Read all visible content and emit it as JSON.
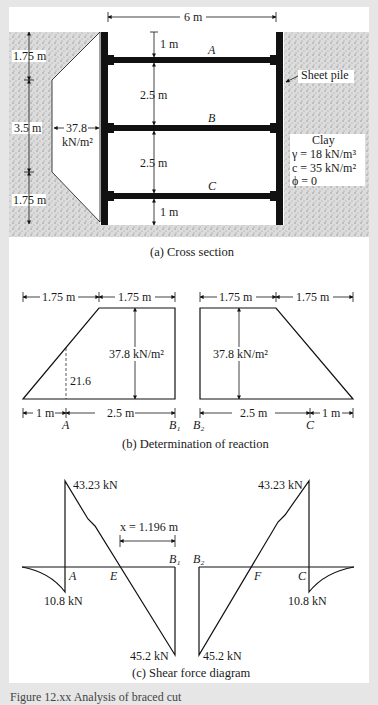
{
  "figure": {
    "caption_partial": "Figure 12.xx  Analysis of braced cut",
    "panels": {
      "a": {
        "caption": "(a) Cross section",
        "width_label": "6 m",
        "strut_labels": [
          "A",
          "B",
          "C"
        ],
        "vertical_spacings": [
          "1 m",
          "2.5 m",
          "2.5 m",
          "1 m"
        ],
        "pressure_zone_heights": [
          "1.75 m",
          "3.5 m",
          "1.75 m"
        ],
        "pressure_value": "37.8",
        "pressure_unit": "kN/m²",
        "sheet_pile_label": "Sheet pile",
        "soil": {
          "name": "Clay",
          "gamma": "γ = 18 kN/m³",
          "c": "c = 35 kN/m²",
          "phi": "ϕ = 0"
        }
      },
      "b": {
        "caption": "(b) Determination of reaction",
        "left": {
          "top_dims": [
            "1.75 m",
            "1.75 m"
          ],
          "bottom_dims": [
            "1 m",
            "2.5 m"
          ],
          "pressure_label": "37.8 kN/m²",
          "intermediate_value": "21.6",
          "support_labels": [
            "A",
            "B₁"
          ]
        },
        "right": {
          "top_dims": [
            "1.75 m",
            "1.75 m"
          ],
          "bottom_dims": [
            "2.5 m",
            "1 m"
          ],
          "pressure_label": "37.8 kN/m²",
          "support_labels": [
            "B₂",
            "C"
          ]
        }
      },
      "c": {
        "caption": "(c) Shear force diagram",
        "left": {
          "max_label": "43.23 kN",
          "min_label": "45.2 kN",
          "end_label": "10.8 kN",
          "x_label": "x = 1.196 m",
          "point_labels": [
            "A",
            "E",
            "B₁"
          ]
        },
        "right": {
          "max_label": "43.23 kN",
          "min_label": "45.2 kN",
          "end_label": "10.8 kN",
          "point_labels": [
            "B₂",
            "F",
            "C"
          ]
        }
      }
    }
  },
  "colors": {
    "line": "#111111",
    "soil": "#c8c8c8",
    "panel": "#ffffff",
    "frame": "#e6e6e6"
  }
}
